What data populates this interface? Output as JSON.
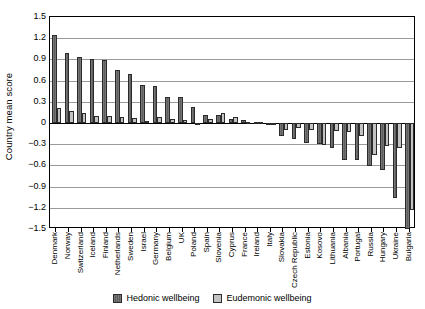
{
  "chart_data": {
    "type": "bar",
    "title": "",
    "subtitle": "",
    "xlabel": "",
    "ylabel": "Country mean score",
    "ylim": [
      -1.5,
      1.5
    ],
    "ytick_labels": [
      "1.5",
      "1.2",
      "0.9",
      "0.6",
      "0.3",
      "0",
      "-0.3",
      "-0.6",
      "-0.9",
      "-1.2",
      "-1.5"
    ],
    "ytick_values": [
      1.5,
      1.2,
      0.9,
      0.6,
      0.3,
      0,
      -0.3,
      -0.6,
      -0.9,
      -1.2,
      -1.5
    ],
    "grid": true,
    "legend_position": "bottom",
    "orientation": "vertical",
    "grouping": "clustered",
    "categories": [
      "Denmark",
      "Norway",
      "Switzerland",
      "Iceland",
      "Finland",
      "Netherlands",
      "Sweden",
      "Israel",
      "Germany",
      "Belgium",
      "UK",
      "Poland",
      "Spain",
      "Slovenia",
      "Cyprus",
      "France",
      "Ireland",
      "Italy",
      "Slovakia",
      "Czech Republic",
      "Estonia",
      "Kosovo",
      "Lithuania",
      "Albania",
      "Portugal",
      "Russia",
      "Hungary",
      "Ukraine",
      "Bulgaria"
    ],
    "series": [
      {
        "name": "Hedonic wellbeing",
        "color": "#5f5f5f",
        "values": [
          1.25,
          0.99,
          0.94,
          0.9,
          0.89,
          0.75,
          0.7,
          0.54,
          0.53,
          0.37,
          0.37,
          0.23,
          0.12,
          0.11,
          0.06,
          0.04,
          0.02,
          -0.02,
          -0.18,
          -0.22,
          -0.28,
          -0.3,
          -0.36,
          -0.52,
          -0.53,
          -0.61,
          -0.66,
          -1.06,
          -1.5
        ]
      },
      {
        "name": "Eudemonic wellbeing",
        "color": "#c3c3c3",
        "values": [
          0.21,
          0.17,
          0.14,
          0.1,
          0.1,
          0.09,
          0.07,
          0.03,
          0.08,
          0.05,
          0.04,
          -0.02,
          0.05,
          0.14,
          0.09,
          0.02,
          0.02,
          -0.01,
          -0.1,
          -0.07,
          -0.1,
          -0.31,
          -0.11,
          -0.13,
          -0.18,
          -0.45,
          -0.32,
          -0.36,
          -1.23
        ]
      }
    ],
    "legend": [
      {
        "label": "Hedonic wellbeing",
        "swatch": "hedonic"
      },
      {
        "label": "Eudemonic wellbeing",
        "swatch": "eudemonic"
      }
    ]
  }
}
